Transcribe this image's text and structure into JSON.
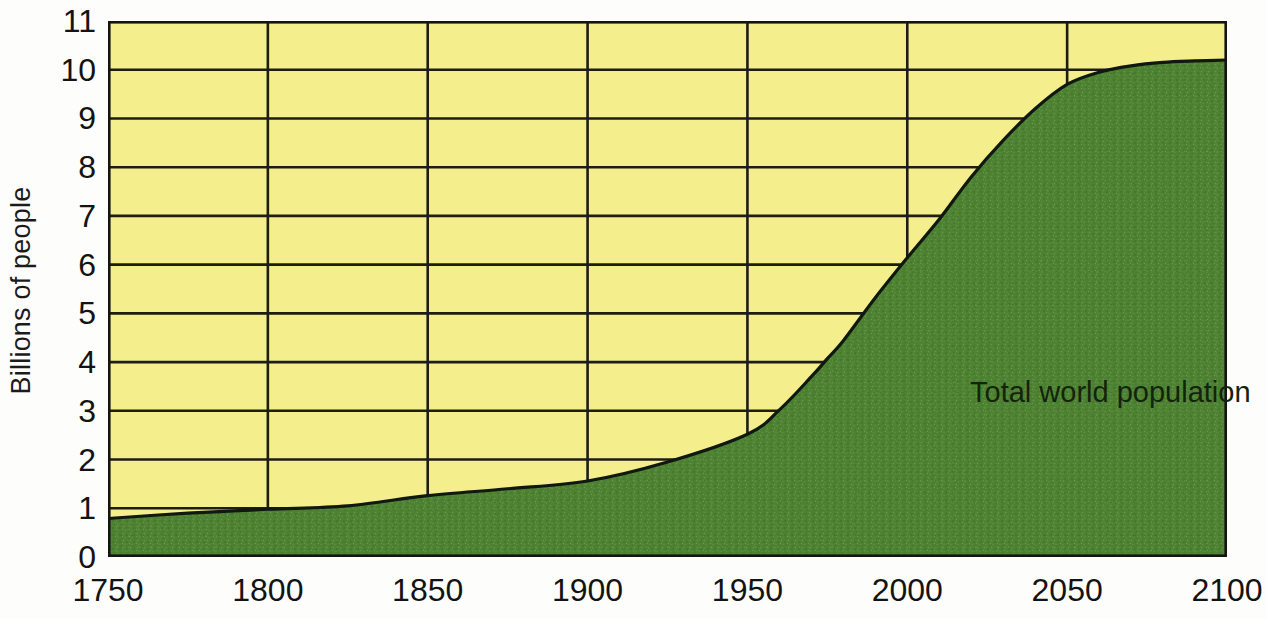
{
  "chart_data": {
    "type": "area",
    "title": "",
    "subtitle": "",
    "xlabel": "",
    "ylabel": "Billions of people",
    "series_label": "Total world population",
    "xlim": [
      1750,
      2100
    ],
    "ylim": [
      0,
      11
    ],
    "grid": true,
    "legend_position": "inline-annotation",
    "x_ticks": [
      "1750",
      "1800",
      "1850",
      "1900",
      "1950",
      "2000",
      "2050",
      "2100"
    ],
    "x_tick_values": [
      1750,
      1800,
      1850,
      1900,
      1950,
      2000,
      2050,
      2100
    ],
    "y_ticks": [
      "0",
      "1",
      "2",
      "3",
      "4",
      "5",
      "6",
      "7",
      "8",
      "9",
      "10",
      "11"
    ],
    "y_tick_values": [
      0,
      1,
      2,
      3,
      4,
      5,
      6,
      7,
      8,
      9,
      10,
      11
    ],
    "x": [
      1750,
      1775,
      1800,
      1825,
      1850,
      1875,
      1900,
      1925,
      1950,
      1960,
      1970,
      1975,
      1980,
      1990,
      2000,
      2010,
      2020,
      2030,
      2040,
      2050,
      2060,
      2070,
      2080,
      2090,
      2100
    ],
    "values": [
      0.79,
      0.9,
      0.98,
      1.05,
      1.26,
      1.4,
      1.56,
      1.95,
      2.52,
      3.02,
      3.7,
      4.07,
      4.44,
      5.32,
      6.14,
      6.93,
      7.8,
      8.55,
      9.2,
      9.7,
      9.95,
      10.08,
      10.15,
      10.18,
      10.2
    ],
    "colors": {
      "area_fill": "#4e8233",
      "background_fill": "#f5ee8c",
      "grid_line": "#1d1d14",
      "axis_line": "#141410",
      "tick_text": "#131313"
    }
  },
  "annotations": {
    "series_label": "Total world population"
  },
  "axes": {
    "y_title": "Billions of people"
  }
}
